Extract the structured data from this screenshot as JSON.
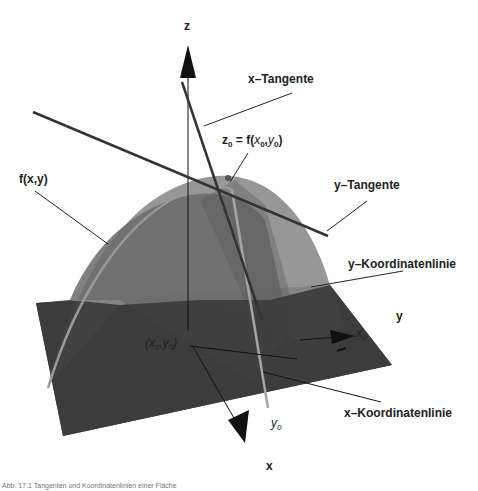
{
  "figure": {
    "axes": {
      "z": "z",
      "y": "y",
      "x": "x"
    },
    "labels": {
      "x_tangent": "x–Tangente",
      "y_tangent": "y–Tangente",
      "point_z0": "z0 = f(x0,y0)",
      "point_z0_parts": {
        "z": "z",
        "sub0": "0",
        "eq": " = f(",
        "x": "x",
        "comma": ",",
        "y": "y",
        "close": ")"
      },
      "surface": "f(x,y)",
      "y_coordinate_line": "y–Koordinatenlinie",
      "x_coordinate_line": "x–Koordinatenlinie",
      "base_point": "(x0,y0)",
      "x0": "x0",
      "y0": "y0"
    },
    "caption": "Abb. 17.1  Tangenten und Koordinatenlinien einer Fläche"
  },
  "colors": {
    "plane": "#3f3f3f",
    "surface_light": "#8a8a8a",
    "surface_dark": "#5f5f5f",
    "tangent_line": "#333333",
    "coord_line": "#9a9a9a",
    "axis": "#111111"
  }
}
